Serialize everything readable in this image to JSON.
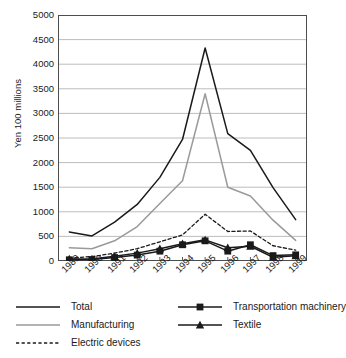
{
  "chart_data": {
    "type": "line",
    "title": "",
    "xlabel": "",
    "ylabel": "Yen 100 millions",
    "ylim": [
      0,
      5000
    ],
    "ytick_values": [
      0,
      500,
      1000,
      1500,
      2000,
      2500,
      3000,
      3500,
      4000,
      4500,
      5000
    ],
    "ytick_labels": [
      "0",
      "500",
      "1000",
      "1500",
      "2000",
      "2500",
      "3000",
      "3500",
      "4000",
      "4500",
      "5000"
    ],
    "grid": true,
    "grid_axis": "y",
    "legend_position": "below",
    "categories": [
      "1989",
      "1990",
      "1991",
      "1992",
      "1993",
      "1994",
      "1995",
      "1996",
      "1997",
      "1998",
      "1999"
    ],
    "series": [
      {
        "name": "Total",
        "style": "solid",
        "color": "#1a1a1a",
        "marker": "none",
        "values": [
          590,
          510,
          790,
          1150,
          1700,
          2470,
          4330,
          2590,
          2250,
          1490,
          840
        ]
      },
      {
        "name": "Manufacturing",
        "style": "solid",
        "color": "#9a9a9a",
        "marker": "none",
        "values": [
          270,
          250,
          410,
          700,
          1170,
          1630,
          3400,
          1500,
          1320,
          830,
          420
        ]
      },
      {
        "name": "Electric devices",
        "style": "dashed",
        "color": "#1a1a1a",
        "marker": "none",
        "values": [
          60,
          90,
          160,
          250,
          390,
          530,
          950,
          600,
          610,
          310,
          220
        ]
      },
      {
        "name": "Transportation machinery",
        "style": "solid",
        "color": "#1a1a1a",
        "marker": "square",
        "values": [
          25,
          30,
          70,
          120,
          200,
          330,
          410,
          200,
          330,
          110,
          125
        ]
      },
      {
        "name": "Textile",
        "style": "solid",
        "color": "#1a1a1a",
        "marker": "triangle",
        "values": [
          40,
          40,
          95,
          160,
          250,
          350,
          430,
          270,
          300,
          75,
          105
        ]
      }
    ]
  },
  "axes": {
    "y_axis_label": "Yen 100 millions"
  },
  "legend": {
    "entries": [
      {
        "label": "Total"
      },
      {
        "label": "Manufacturing"
      },
      {
        "label": "Electric devices"
      },
      {
        "label": "Transportation machinery"
      },
      {
        "label": "Textile"
      }
    ]
  },
  "colors": {
    "total": "#1a1a1a",
    "manufacturing": "#9a9a9a",
    "electric_devices": "#1a1a1a",
    "transportation_machinery": "#1a1a1a",
    "textile": "#1a1a1a",
    "grid": "#b5b5b5",
    "axis": "#4d4d4d",
    "background": "#ffffff"
  }
}
